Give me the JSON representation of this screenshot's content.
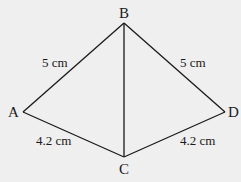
{
  "diagram": {
    "type": "geometry-kite",
    "background": "#efefef",
    "stroke_color": "#1a1a1a",
    "vertices": [
      {
        "id": "A",
        "label": "A",
        "x": 23,
        "y": 112
      },
      {
        "id": "B",
        "label": "B",
        "x": 124,
        "y": 23
      },
      {
        "id": "C",
        "label": "C",
        "x": 124,
        "y": 157
      },
      {
        "id": "D",
        "label": "D",
        "x": 225,
        "y": 112
      }
    ],
    "edges": [
      {
        "from": "A",
        "to": "B",
        "label": "5 cm"
      },
      {
        "from": "B",
        "to": "D",
        "label": "5 cm"
      },
      {
        "from": "A",
        "to": "C",
        "label": "4.2 cm"
      },
      {
        "from": "C",
        "to": "D",
        "label": "4.2 cm"
      },
      {
        "from": "B",
        "to": "C",
        "label": ""
      }
    ]
  },
  "labels": {
    "A": "A",
    "B": "B",
    "C": "C",
    "D": "D",
    "AB": "5 cm",
    "BD": "5 cm",
    "AC": "4.2 cm",
    "CD": "4.2 cm"
  }
}
